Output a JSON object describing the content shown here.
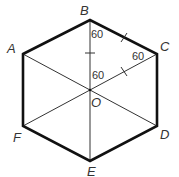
{
  "diagram": {
    "colors": {
      "outline": "#111111",
      "diagonal": "#333333",
      "text": "#333333",
      "background": "#ffffff"
    },
    "vertices": {
      "A": {
        "label": "A",
        "x": 23,
        "y": 54
      },
      "B": {
        "label": "B",
        "x": 90,
        "y": 20
      },
      "C": {
        "label": "C",
        "x": 157,
        "y": 54
      },
      "D": {
        "label": "D",
        "x": 157,
        "y": 126
      },
      "E": {
        "label": "E",
        "x": 90,
        "y": 161
      },
      "F": {
        "label": "F",
        "x": 23,
        "y": 126
      },
      "O": {
        "label": "O",
        "x": 90,
        "y": 90
      }
    },
    "angle_labels": [
      {
        "text": "60",
        "x": 93,
        "y": 38
      },
      {
        "text": "60",
        "x": 133,
        "y": 60
      },
      {
        "text": "60",
        "x": 93,
        "y": 79
      }
    ],
    "diagonals": [
      "AD",
      "BE",
      "CF"
    ],
    "tick_marks": [
      "BO",
      "BC",
      "OC"
    ]
  }
}
